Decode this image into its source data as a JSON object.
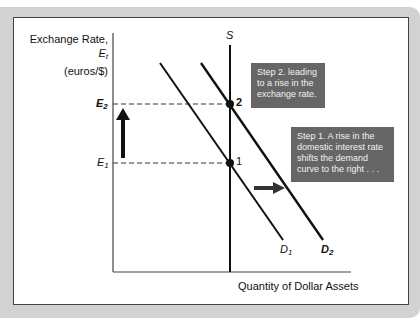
{
  "diagram": {
    "y_axis": {
      "label_main": "Exchange Rate, ",
      "label_var": "E",
      "label_sub": "t",
      "label_units": "(euros/$)"
    },
    "x_axis": {
      "label": "Quantity of Dollar Assets"
    },
    "levels": [
      {
        "id": "E2",
        "var": "E",
        "sub": "2"
      },
      {
        "id": "E1",
        "var": "E",
        "sub": "1"
      }
    ],
    "curves": {
      "supply": {
        "label": "S"
      },
      "demand_1": {
        "var": "D",
        "sub": "1"
      },
      "demand_2": {
        "var": "D",
        "sub": "2"
      }
    },
    "points": [
      {
        "label": "2"
      },
      {
        "label": "1"
      }
    ],
    "callouts": {
      "step2": "Step 2. leading to a rise in the exchange rate.",
      "step1": "Step 1. A rise in the domestic interest rate shifts the demand curve to the right . . ."
    },
    "colors": {
      "panel": "#d2d2d2",
      "callout_bg": "#666666",
      "line": "#111111"
    }
  }
}
